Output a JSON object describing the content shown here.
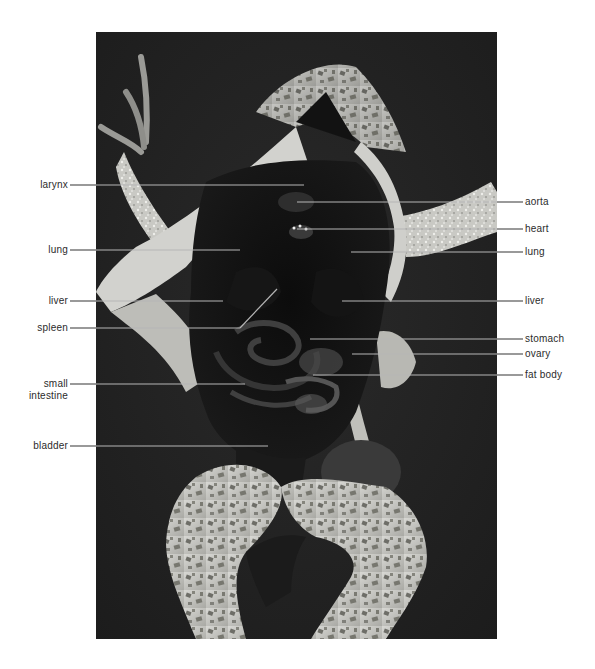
{
  "figure": {
    "colors": {
      "page_background": "#ffffff",
      "photo_background": "#222222",
      "label_text": "#2b2b2b",
      "leader_outside": "#555555",
      "leader_inside": "#b5b5b5"
    },
    "labels_left": [
      {
        "id": "larynx",
        "lines": [
          "larynx"
        ],
        "y": 185,
        "line_end_x": 304
      },
      {
        "id": "lung-left",
        "lines": [
          "lung"
        ],
        "y": 250,
        "line_end_x": 240
      },
      {
        "id": "liver-left",
        "lines": [
          "liver"
        ],
        "y": 301,
        "line_end_x": 223
      },
      {
        "id": "spleen",
        "lines": [
          "spleen"
        ],
        "y": 328,
        "line_end_x": 240,
        "bend_to": [
          277,
          289
        ]
      },
      {
        "id": "small-intestine",
        "lines": [
          "small",
          "intestine"
        ],
        "y": 384,
        "line_end_x": 245
      },
      {
        "id": "bladder",
        "lines": [
          "bladder"
        ],
        "y": 446,
        "line_end_x": 268
      }
    ],
    "labels_right": [
      {
        "id": "aorta",
        "lines": [
          "aorta"
        ],
        "y": 202,
        "line_start_x": 297
      },
      {
        "id": "heart",
        "lines": [
          "heart"
        ],
        "y": 229,
        "line_start_x": 297
      },
      {
        "id": "lung-right",
        "lines": [
          "lung"
        ],
        "y": 252,
        "line_start_x": 351
      },
      {
        "id": "liver-right",
        "lines": [
          "liver"
        ],
        "y": 301,
        "line_start_x": 342
      },
      {
        "id": "stomach",
        "lines": [
          "stomach"
        ],
        "y": 339,
        "line_start_x": 310
      },
      {
        "id": "ovary",
        "lines": [
          "ovary"
        ],
        "y": 354,
        "line_start_x": 352
      },
      {
        "id": "fat-body",
        "lines": [
          "fat body"
        ],
        "y": 375,
        "line_start_x": 313
      }
    ]
  }
}
